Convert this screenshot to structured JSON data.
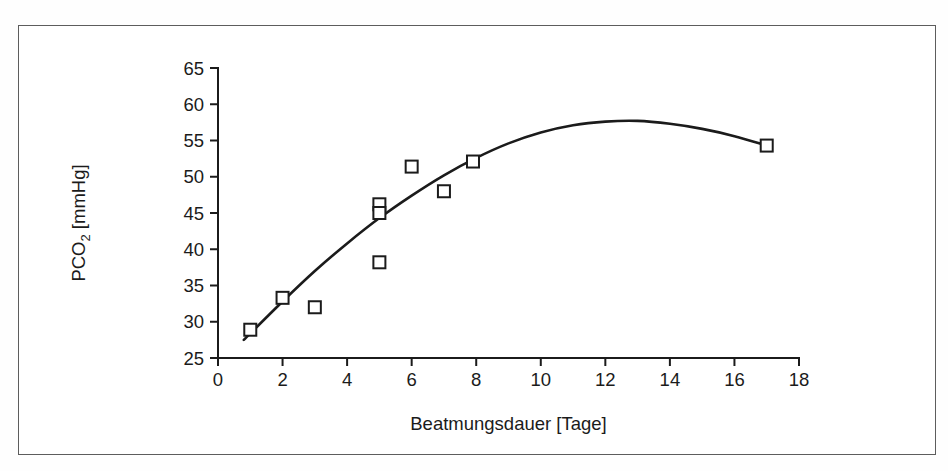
{
  "figure": {
    "frame_color": "#5d5d5d",
    "background": "#ffffff"
  },
  "chart_data": {
    "type": "scatter",
    "title": "",
    "xlabel": "Beatmungsdauer [Tage]",
    "ylabel": "PCO2 [mmHg]",
    "ylabel_base": "PCO",
    "ylabel_sub": "2",
    "ylabel_unit": " [mmHg]",
    "xlim": [
      0,
      18
    ],
    "ylim": [
      25,
      65
    ],
    "xticks": [
      0,
      2,
      4,
      6,
      8,
      10,
      12,
      14,
      16,
      18
    ],
    "xtick_labels": [
      "0",
      "2",
      "4",
      "6",
      "8",
      "10",
      "12",
      "14",
      "16",
      "18"
    ],
    "yticks": [
      25,
      30,
      35,
      40,
      45,
      50,
      55,
      60,
      65
    ],
    "ytick_labels": [
      "25",
      "30",
      "35",
      "40",
      "45",
      "50",
      "55",
      "60",
      "65"
    ],
    "grid": false,
    "legend": false,
    "marker": "open-square",
    "marker_color": "#1b1b1b",
    "curve_color": "#1b1b1b",
    "points": [
      {
        "x": 1.0,
        "y": 28.9
      },
      {
        "x": 2.0,
        "y": 33.3
      },
      {
        "x": 3.0,
        "y": 32.0
      },
      {
        "x": 5.0,
        "y": 46.2
      },
      {
        "x": 5.0,
        "y": 45.0
      },
      {
        "x": 5.0,
        "y": 38.2
      },
      {
        "x": 6.0,
        "y": 51.4
      },
      {
        "x": 7.0,
        "y": 48.0
      },
      {
        "x": 7.9,
        "y": 52.1
      },
      {
        "x": 17.0,
        "y": 54.3
      }
    ],
    "fit_curve": {
      "description": "quadratic regression curve",
      "x_range": [
        0.8,
        17.0
      ],
      "peak": {
        "x": 12.8,
        "y": 57.7
      },
      "samples": [
        {
          "x": 0.8,
          "y": 27.5
        },
        {
          "x": 2.0,
          "y": 32.8
        },
        {
          "x": 3.0,
          "y": 37.0
        },
        {
          "x": 4.0,
          "y": 40.8
        },
        {
          "x": 5.0,
          "y": 44.3
        },
        {
          "x": 6.0,
          "y": 47.4
        },
        {
          "x": 7.0,
          "y": 50.2
        },
        {
          "x": 8.0,
          "y": 52.6
        },
        {
          "x": 9.0,
          "y": 54.6
        },
        {
          "x": 10.0,
          "y": 56.1
        },
        {
          "x": 11.0,
          "y": 57.1
        },
        {
          "x": 12.0,
          "y": 57.6
        },
        {
          "x": 13.0,
          "y": 57.7
        },
        {
          "x": 14.0,
          "y": 57.3
        },
        {
          "x": 15.0,
          "y": 56.6
        },
        {
          "x": 16.0,
          "y": 55.6
        },
        {
          "x": 17.0,
          "y": 54.3
        }
      ]
    }
  }
}
